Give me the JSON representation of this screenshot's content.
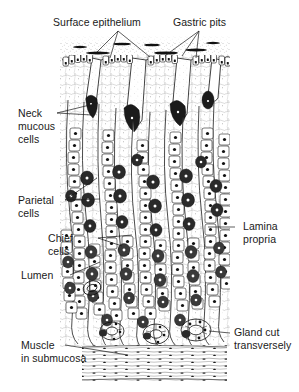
{
  "figure": {
    "style": "black-and-white line drawing / stipple engraving",
    "background_color": "#ffffff",
    "ink_color": "#1a1a1a"
  },
  "labels": {
    "surface_epithelium": "Surface epithelium",
    "gastric_pits": "Gastric pits",
    "neck_mucous_cells_l1": "Neck",
    "neck_mucous_cells_l2": "mucous",
    "neck_mucous_cells_l3": "cells",
    "parietal_cells_l1": "Parietal",
    "parietal_cells_l2": "cells",
    "chief_cells_l1": "Chief",
    "chief_cells_l2": "cells",
    "lumen": "Lumen",
    "lamina_propria_l1": "Lamina",
    "lamina_propria_l2": "propria",
    "gland_cut_l1": "Gland cut",
    "gland_cut_l2": "transversely",
    "muscle_l1": "Muscle",
    "muscle_l2": "in submucosa"
  },
  "structures": [
    {
      "name": "surface-epithelium",
      "description": "stippled luminal surface band at top of mucosa"
    },
    {
      "name": "gastric-pits",
      "description": "invaginations of surface epithelium descending into mucosa"
    },
    {
      "name": "neck-mucous-cells",
      "description": "darkly shaded cells in the narrow neck region of the gastric glands"
    },
    {
      "name": "parietal-cells",
      "description": "large rounded acid-secreting cells in gland wall"
    },
    {
      "name": "chief-cells",
      "description": "pepsinogen-secreting cells at gland base, dark stippled"
    },
    {
      "name": "lumen",
      "description": "open central channel of a gastric gland"
    },
    {
      "name": "lamina-propria",
      "description": "loose connective tissue between glands"
    },
    {
      "name": "gland-cut-transversely",
      "description": "gland sectioned across its axis, ring of cells"
    },
    {
      "name": "muscle-in-submucosa",
      "description": "dense band of smooth muscle fibers at base of figure (muscularis mucosae / submucosa)"
    }
  ]
}
